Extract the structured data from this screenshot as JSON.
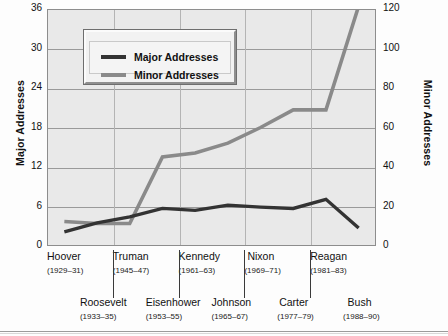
{
  "chart_data": {
    "type": "line",
    "title": "",
    "subtitle": "",
    "categories": [
      "Hoover",
      "Roosevelt",
      "Truman",
      "Eisenhower",
      "Kennedy",
      "Johnson",
      "Nixon",
      "Carter",
      "Reagan",
      "Bush"
    ],
    "category_years": [
      "(1929–31)",
      "(1933–35)",
      "(1945–47)",
      "(1953–55)",
      "(1961–63)",
      "(1965–67)",
      "(1969–71)",
      "(1977–79)",
      "(1981–83)",
      "(1988–90)"
    ],
    "series": [
      {
        "name": "Major Addresses",
        "axis": "left",
        "color": "#333333",
        "values": [
          2,
          3.4,
          4.3,
          5.6,
          5.3,
          6.1,
          5.8,
          5.6,
          7.0,
          2.6
        ]
      },
      {
        "name": "Minor Addresses",
        "axis": "right",
        "color": "#8a8a8a",
        "values": [
          12,
          11,
          11,
          45,
          47,
          52,
          60,
          69,
          69,
          122
        ]
      }
    ],
    "xlabel": "",
    "ylabel": "Major Addresses",
    "y2label": "Minor Addresses",
    "ylim": [
      0,
      36
    ],
    "y2lim": [
      0,
      120
    ],
    "yticks": [
      "0",
      "6",
      "12",
      "18",
      "24",
      "30",
      "36"
    ],
    "y2ticks": [
      "0",
      "20",
      "40",
      "60",
      "80",
      "100",
      "120"
    ],
    "grid": true,
    "legend_position": "top-left-inset"
  },
  "legend": {
    "entries": [
      {
        "label": "Major Addresses",
        "color": "#333333"
      },
      {
        "label": "Minor Addresses",
        "color": "#8a8a8a"
      }
    ]
  },
  "axes": {
    "left_title": "Major Addresses",
    "right_title": "Minor Addresses"
  }
}
